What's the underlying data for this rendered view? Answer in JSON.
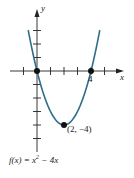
{
  "figure": {
    "formula": {
      "prefix": "f(x) = x",
      "exponent": "2",
      "suffix": " − 4x"
    },
    "axis_labels": {
      "x": "x",
      "y": "y"
    },
    "x_tick_label": "4",
    "vertex_label": "(2, −4)"
  },
  "colors": {
    "curve": "#2e6d8c",
    "axis": "#222222",
    "point": "#111111"
  },
  "chart_data": {
    "type": "line",
    "function": "x^2 - 4x",
    "xlabel": "x",
    "ylabel": "y",
    "xlim": [
      -2,
      6
    ],
    "ylim": [
      -6,
      4
    ],
    "x_ticks": [
      -1,
      0,
      1,
      2,
      3,
      4,
      5
    ],
    "y_ticks": [
      -5,
      -4,
      -3,
      -2,
      -1,
      1,
      2,
      3
    ],
    "labeled_ticks": [
      {
        "axis": "x",
        "value": 4,
        "label": "4"
      }
    ],
    "points": [
      {
        "x": 0,
        "y": 0,
        "label": ""
      },
      {
        "x": 4,
        "y": 0,
        "label": "4"
      },
      {
        "x": 2,
        "y": -4,
        "label": "(2, −4)"
      }
    ],
    "curve_x_range": [
      -0.65,
      4.65
    ],
    "grid": false
  }
}
